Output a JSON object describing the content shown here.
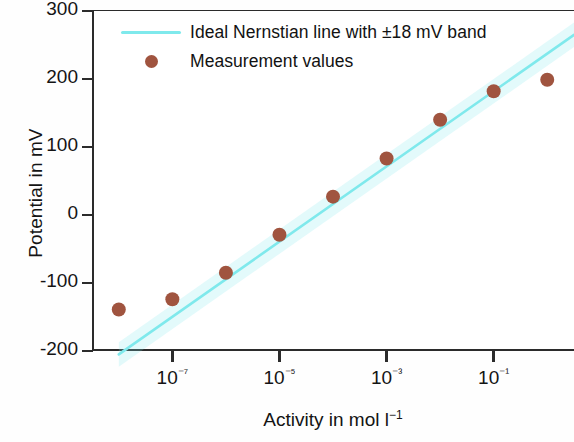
{
  "chart_data": {
    "type": "scatter",
    "title": "",
    "xlabel": "Activity in mol l⁻¹",
    "ylabel": "Potential in mV",
    "xscale": "log",
    "xlim": [
      3.16e-09,
      3.16
    ],
    "ylim": [
      -200,
      300
    ],
    "grid": false,
    "legend_position": "upper-left-inside",
    "xtick_labels": [
      "10⁻⁷",
      "10⁻⁵",
      "10⁻³",
      "10⁻¹"
    ],
    "xtick_values": [
      1e-07,
      1e-05,
      0.001,
      0.1
    ],
    "ytick_labels": [
      "300",
      "200",
      "100",
      "0",
      "-100",
      "-200"
    ],
    "ytick_values": [
      300,
      200,
      100,
      0,
      -100,
      -200
    ],
    "series": [
      {
        "name": "Ideal Nernstian line with ±18 mV band",
        "type": "line",
        "color": "#7fe9ec",
        "band_mV": 18,
        "x": [
          1e-08,
          3.16
        ],
        "y": [
          -205,
          265
        ]
      },
      {
        "name": "Measurement values",
        "type": "scatter",
        "color": "#a0543f",
        "x": [
          1e-08,
          1e-07,
          1e-06,
          1e-05,
          0.0001,
          0.001,
          0.01,
          0.1,
          1.0
        ],
        "y": [
          -139,
          -124,
          -85,
          -29,
          27,
          83,
          140,
          182,
          199
        ]
      }
    ]
  },
  "legend": {
    "items": [
      {
        "label": "Ideal Nernstian line with ±18 mV band",
        "marker": "line",
        "color": "#7fe9ec"
      },
      {
        "label": "Measurement values",
        "marker": "dot",
        "color": "#a0543f"
      }
    ]
  },
  "axes": {
    "x_title_main": "Activity in mol l",
    "x_title_sup": "−1",
    "y_title": "Potential in mV"
  }
}
